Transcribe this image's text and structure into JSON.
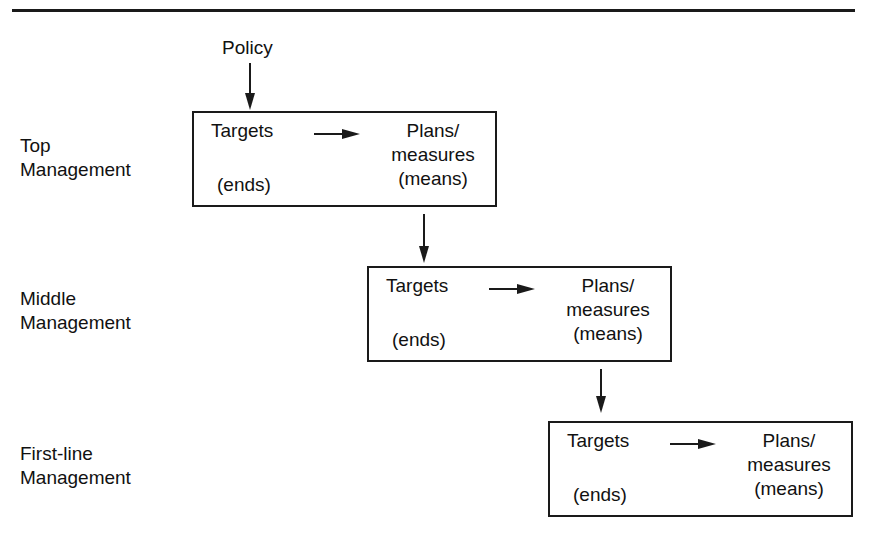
{
  "diagram": {
    "type": "hierarchical-flow",
    "input": {
      "label": "Policy"
    },
    "levels": [
      {
        "name": "Top Management",
        "label_lines": [
          "Top",
          "Management"
        ],
        "box": {
          "left_term": "Targets",
          "left_note": "(ends)",
          "right_lines": [
            "Plans/",
            "measures",
            "(means)"
          ]
        }
      },
      {
        "name": "Middle Management",
        "label_lines": [
          "Middle",
          "Management"
        ],
        "box": {
          "left_term": "Targets",
          "left_note": "(ends)",
          "right_lines": [
            "Plans/",
            "measures",
            "(means)"
          ]
        }
      },
      {
        "name": "First-line Management",
        "label_lines": [
          "First-line",
          "Management"
        ],
        "box": {
          "left_term": "Targets",
          "left_note": "(ends)",
          "right_lines": [
            "Plans/",
            "measures",
            "(means)"
          ]
        }
      }
    ],
    "edges": [
      {
        "from": "Policy",
        "to": "Top Management.Targets"
      },
      {
        "from": "Top Management.Targets",
        "to": "Top Management.Plans/measures"
      },
      {
        "from": "Top Management.Plans/measures",
        "to": "Middle Management.Targets"
      },
      {
        "from": "Middle Management.Targets",
        "to": "Middle Management.Plans/measures"
      },
      {
        "from": "Middle Management.Plans/measures",
        "to": "First-line Management.Targets"
      },
      {
        "from": "First-line Management.Targets",
        "to": "First-line Management.Plans/measures"
      }
    ],
    "colors": {
      "ink": "#1a1a1a",
      "background": "#ffffff"
    }
  }
}
